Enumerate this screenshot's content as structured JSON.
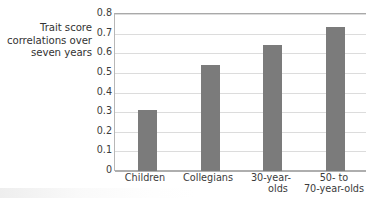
{
  "chart_data": {
    "type": "bar",
    "title": "",
    "subtitle": "",
    "xlabel": "",
    "ylabel": "Trait score correlations over seven years",
    "ylabel_lines": [
      "Trait score",
      "correlations over",
      "seven years"
    ],
    "categories": [
      "Children",
      "Collegians",
      "30-year-olds",
      "50- to 70-year-olds"
    ],
    "category_label_lines": [
      [
        "Children"
      ],
      [
        "Collegians"
      ],
      [
        "30-year-",
        "olds"
      ],
      [
        "50- to",
        "70-year-olds"
      ]
    ],
    "values": [
      0.31,
      0.54,
      0.64,
      0.735
    ],
    "ylim": [
      0,
      0.8
    ],
    "ytick_values": [
      0.8,
      0.7,
      0.6,
      0.5,
      0.4,
      0.3,
      0.2,
      0.1,
      0
    ],
    "ytick_labels": [
      "0.8",
      "0.7",
      "0.6",
      "0.5",
      "0.4",
      "0.3",
      "0.2",
      "0.1",
      "0"
    ],
    "grid": "horizontal",
    "legend": "none",
    "bar_color": "#7b7b7b",
    "gridline_color": "#dcdcdc",
    "axis_color": "#aeaeae",
    "text_color": "#3b3b3b",
    "background_color": "#ffffff"
  }
}
